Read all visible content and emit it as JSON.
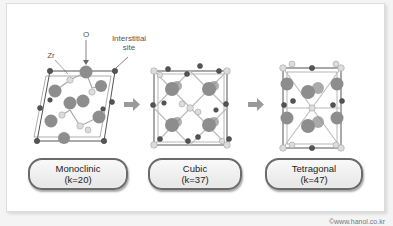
{
  "diagram": {
    "structures": [
      {
        "name": "Monoclinic",
        "k_label": "(k=20)"
      },
      {
        "name": "Cubic",
        "k_label": "(k=37)"
      },
      {
        "name": "Tetragonal",
        "k_label": "(k=47)"
      }
    ],
    "annotations": {
      "zr": "Zr",
      "o": "O",
      "interstitial_line1": "Interstitial",
      "interstitial_line2": "site"
    },
    "arrows": [
      "monoclinic-to-cubic",
      "cubic-to-tetragonal"
    ],
    "colors": {
      "zr_atom": "#8a8a8a",
      "o_atom": "#d8d8d8",
      "interstitial": "#555555",
      "arrow": "#9a9a9a",
      "pill_border": "#6a6a6a"
    }
  },
  "credit": "©www.hanol.co.kr"
}
